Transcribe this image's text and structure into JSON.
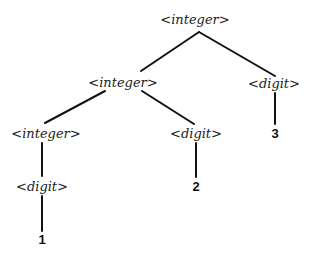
{
  "diagram": {
    "type": "parse-tree",
    "nodes": {
      "root": {
        "label": "<integer>",
        "kind": "nonterminal"
      },
      "mid_integer": {
        "label": "<integer>",
        "kind": "nonterminal"
      },
      "right_digit": {
        "label": "<digit>",
        "kind": "nonterminal"
      },
      "left_integer": {
        "label": "<integer>",
        "kind": "nonterminal"
      },
      "mid_digit": {
        "label": "<digit>",
        "kind": "nonterminal"
      },
      "low_digit": {
        "label": "<digit>",
        "kind": "nonterminal"
      },
      "leaf_1": {
        "label": "1",
        "kind": "terminal"
      },
      "leaf_2": {
        "label": "2",
        "kind": "terminal"
      },
      "leaf_3": {
        "label": "3",
        "kind": "terminal"
      }
    },
    "edges": [
      [
        "root",
        "mid_integer"
      ],
      [
        "root",
        "right_digit"
      ],
      [
        "mid_integer",
        "left_integer"
      ],
      [
        "mid_integer",
        "mid_digit"
      ],
      [
        "left_integer",
        "low_digit"
      ],
      [
        "low_digit",
        "leaf_1"
      ],
      [
        "mid_digit",
        "leaf_2"
      ],
      [
        "right_digit",
        "leaf_3"
      ]
    ],
    "line_color": "#111111"
  }
}
